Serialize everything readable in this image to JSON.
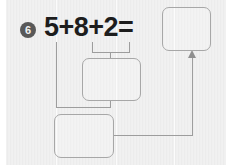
{
  "worksheet": {
    "problem_number": "6",
    "equation": "5+8+2=",
    "background_color": "#ececec",
    "ink_color": "#1d1d1d",
    "badge_color": "#595959",
    "box_border_color": "#a7a7a7",
    "connector_color": "#9d9d9d"
  },
  "answer_boxes": [
    {
      "id": "sum",
      "label": "",
      "placeholder": ""
    },
    {
      "id": "middle",
      "label": "",
      "placeholder": ""
    },
    {
      "id": "bottom",
      "label": "",
      "placeholder": ""
    }
  ],
  "connectors": {
    "bracket_over_middle_box": "8+2",
    "line_from_first_addend": "5",
    "arrow_target": "sum"
  },
  "icons": {
    "arrow_up": "arrow-up-icon"
  }
}
